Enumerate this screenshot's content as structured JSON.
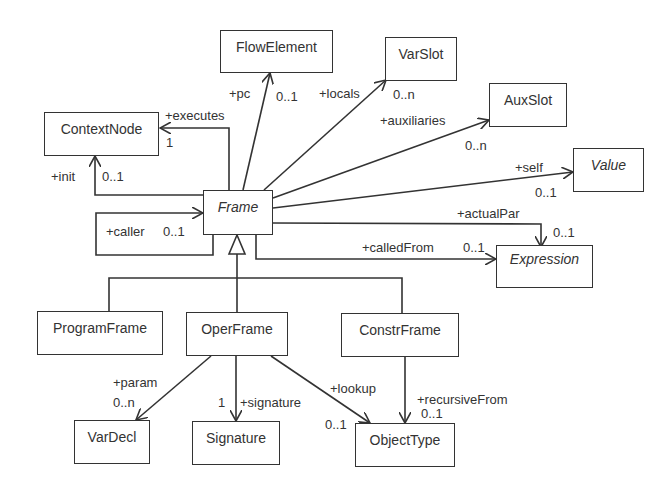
{
  "diagram": {
    "type": "UML class diagram",
    "classes": {
      "flowelement": {
        "name": "FlowElement",
        "abstract": false
      },
      "varslot": {
        "name": "VarSlot",
        "abstract": false
      },
      "auxslot": {
        "name": "AuxSlot",
        "abstract": false
      },
      "contextnode": {
        "name": "ContextNode",
        "abstract": false
      },
      "value": {
        "name": "Value",
        "abstract": true
      },
      "frame": {
        "name": "Frame",
        "abstract": true
      },
      "expression": {
        "name": "Expression",
        "abstract": true
      },
      "programframe": {
        "name": "ProgramFrame",
        "abstract": false
      },
      "operframe": {
        "name": "OperFrame",
        "abstract": false
      },
      "constrframe": {
        "name": "ConstrFrame",
        "abstract": false
      },
      "vardecl": {
        "name": "VarDecl",
        "abstract": false
      },
      "signature": {
        "name": "Signature",
        "abstract": false
      },
      "objecttype": {
        "name": "ObjectType",
        "abstract": false
      }
    },
    "associations": {
      "pc": {
        "from": "Frame",
        "to": "FlowElement",
        "role": "+pc",
        "mult": "0..1"
      },
      "locals": {
        "from": "Frame",
        "to": "VarSlot",
        "role": "+locals",
        "mult": "0..n"
      },
      "auxiliaries": {
        "from": "Frame",
        "to": "AuxSlot",
        "role": "+auxiliaries",
        "mult": "0..n"
      },
      "executes": {
        "from": "Frame",
        "to": "ContextNode",
        "role": "+executes",
        "mult": "1"
      },
      "init": {
        "from": "Frame",
        "to": "ContextNode",
        "role": "+init",
        "mult": "0..1"
      },
      "self": {
        "from": "Frame",
        "to": "Value",
        "role": "+self",
        "mult": "0..1"
      },
      "actualPar": {
        "from": "Frame",
        "to": "Expression",
        "role": "+actualPar",
        "mult": "0..1"
      },
      "calledFrom": {
        "from": "Frame",
        "to": "Expression",
        "role": "+calledFrom",
        "mult": "0..1"
      },
      "caller": {
        "from": "Frame",
        "to": "Frame",
        "role": "+caller",
        "mult": "0..1"
      },
      "param": {
        "from": "OperFrame",
        "to": "VarDecl",
        "role": "+param",
        "mult": "0..n"
      },
      "signature": {
        "from": "OperFrame",
        "to": "Signature",
        "role": "+signature",
        "mult": "1"
      },
      "lookup": {
        "from": "OperFrame",
        "to": "ObjectType",
        "role": "+lookup",
        "mult": "0..1"
      },
      "recursiveFrom": {
        "from": "ConstrFrame",
        "to": "ObjectType",
        "role": "+recursiveFrom",
        "mult": "0..1"
      }
    },
    "generalizations": [
      {
        "child": "ProgramFrame",
        "parent": "Frame"
      },
      {
        "child": "OperFrame",
        "parent": "Frame"
      },
      {
        "child": "ConstrFrame",
        "parent": "Frame"
      }
    ],
    "colors": {
      "line": "#333333",
      "background": "#ffffff"
    }
  }
}
